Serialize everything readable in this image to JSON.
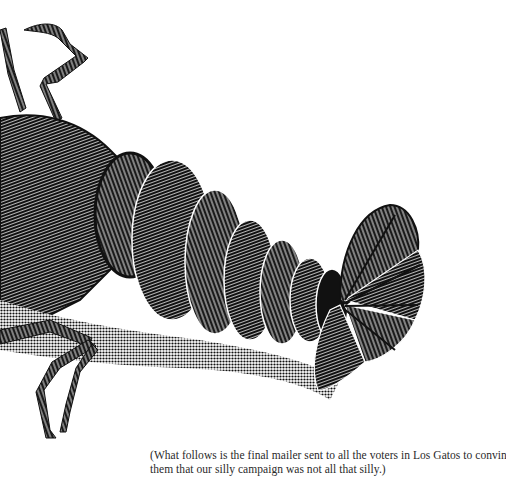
{
  "illustration": {
    "subject": "lobster-engraving",
    "description": "Black and white engraved illustration of the rear half of a lobster: antenna and legs at top left, segmented abdomen curving right, fanned tail at right, walking legs at lower left",
    "ink_color": "#111111",
    "paper_color": "#ffffff"
  },
  "caption": {
    "line1": "(What follows is the final mailer sent to all the voters in Los Gatos to convince",
    "line2": "them that our silly campaign was not all that silly.)"
  }
}
